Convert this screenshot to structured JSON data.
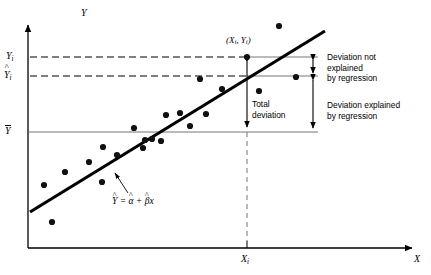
{
  "figure": {
    "axes": {
      "y_axis_label": "Y",
      "x_axis_label": "X"
    },
    "y_ticks": [
      {
        "name": "observed",
        "label": "Y",
        "subscript": "i",
        "decoration": "none",
        "value_y": 57
      },
      {
        "name": "fitted",
        "label": "Y",
        "subscript": "i",
        "decoration": "hat",
        "value_y": 76
      },
      {
        "name": "mean",
        "label": "Y",
        "subscript": "",
        "decoration": "bar",
        "value_y": 132
      }
    ],
    "x_ticks": [
      {
        "name": "xi",
        "label": "X",
        "subscript": "i",
        "value_x": 247
      }
    ],
    "point_label": "(X",
    "point_label_sub1": "i",
    "point_label_mid": ", Y",
    "point_label_sub2": "i",
    "point_label_end": ")",
    "equation": {
      "lhs": "Y",
      "eq": " = ",
      "alpha": "α",
      "plus": " + ",
      "beta": "β",
      "x": "x"
    },
    "annotations": {
      "total_deviation": "Total\ndeviation",
      "unexplained": "Deviation not\nexplained\nby regression",
      "explained": "Deviation explained\nby regression"
    },
    "colors": {
      "ink": "#000000",
      "reference_line": "#555555",
      "regression_line": "#000000",
      "point_fill": "#111111"
    }
  },
  "chart_data": {
    "type": "scatter",
    "title": "",
    "xlabel": "X",
    "ylabel": "Y",
    "grid": false,
    "legend": "none",
    "xlim": [
      0,
      431
    ],
    "ylim": [
      0,
      275
    ],
    "axis_origin_px": {
      "x": 28,
      "y": 248
    },
    "scatter_points_px": [
      {
        "x": 44,
        "y": 185
      },
      {
        "x": 52,
        "y": 222
      },
      {
        "x": 65,
        "y": 172
      },
      {
        "x": 89,
        "y": 162
      },
      {
        "x": 102,
        "y": 182
      },
      {
        "x": 103,
        "y": 147
      },
      {
        "x": 117,
        "y": 155
      },
      {
        "x": 134,
        "y": 128
      },
      {
        "x": 143,
        "y": 148
      },
      {
        "x": 145,
        "y": 140
      },
      {
        "x": 152,
        "y": 139
      },
      {
        "x": 161,
        "y": 141
      },
      {
        "x": 166,
        "y": 115
      },
      {
        "x": 180,
        "y": 113
      },
      {
        "x": 190,
        "y": 126
      },
      {
        "x": 200,
        "y": 79
      },
      {
        "x": 206,
        "y": 114
      },
      {
        "x": 222,
        "y": 89
      },
      {
        "x": 247,
        "y": 57
      },
      {
        "x": 259,
        "y": 91
      },
      {
        "x": 279,
        "y": 26
      },
      {
        "x": 296,
        "y": 77
      }
    ],
    "regression_line_px": {
      "x1": 30,
      "y1": 212,
      "x2": 325,
      "y2": 31
    },
    "reference_lines": [
      {
        "name": "Yi-level",
        "y_px": 57,
        "dashed_from_x": 30,
        "dashed_to_x": 247,
        "solid_to_x": 318
      },
      {
        "name": "Yhat-level",
        "y_px": 76,
        "dashed_from_x": 30,
        "dashed_to_x": 247,
        "solid_to_x": 318
      },
      {
        "name": "Ybar-level",
        "y_px": 132,
        "dashed_from_x": 0,
        "dashed_to_x": 0,
        "solid_to_x": 318
      }
    ],
    "dropline_px": {
      "x": 247,
      "y_top": 132,
      "y_bottom": 248,
      "style": "dashed"
    },
    "deviation_arrows_px": [
      {
        "name": "total-deviation",
        "x": 247,
        "y_top": 57,
        "y_bottom": 132
      },
      {
        "name": "unexplained-deviation",
        "x": 313,
        "y_top": 57,
        "y_bottom": 76
      },
      {
        "name": "explained-deviation",
        "x": 313,
        "y_top": 76,
        "y_bottom": 132
      }
    ]
  }
}
